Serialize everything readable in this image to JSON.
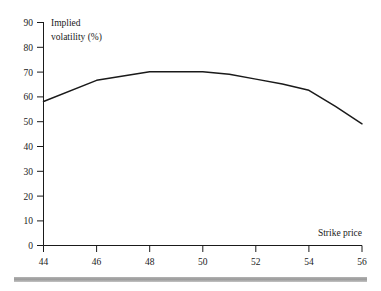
{
  "chart_data": {
    "type": "line",
    "title": "",
    "subtitle": "",
    "xlabel": "Strike price",
    "ylabel": "Implied volatility (%)",
    "ylabel_line1": "Implied",
    "ylabel_line2": "volatility (%)",
    "xlim": [
      44,
      56
    ],
    "ylim": [
      0,
      90
    ],
    "xticks": [
      44,
      46,
      48,
      50,
      52,
      54,
      56
    ],
    "yticks": [
      0,
      10,
      20,
      30,
      40,
      50,
      60,
      70,
      80,
      90
    ],
    "xtick_labels": [
      "44",
      "46",
      "48",
      "50",
      "52",
      "54",
      "56"
    ],
    "ytick_labels": [
      "0",
      "10",
      "20",
      "30",
      "40",
      "50",
      "60",
      "70",
      "80",
      "90"
    ],
    "grid": false,
    "legend": null,
    "series": [
      {
        "name": "Implied volatility",
        "color": "#1a1a1a",
        "x": [
          44,
          46,
          48,
          49,
          50,
          51,
          52,
          53,
          54,
          55,
          56
        ],
        "values": [
          58,
          66.5,
          70,
          70,
          70,
          69,
          67,
          65,
          62.5,
          56,
          49
        ]
      }
    ],
    "annotations": []
  },
  "figure": {
    "rule_bar_color": "#9a9a9a",
    "axis_color": "#1a1a1a",
    "background": "#ffffff"
  }
}
